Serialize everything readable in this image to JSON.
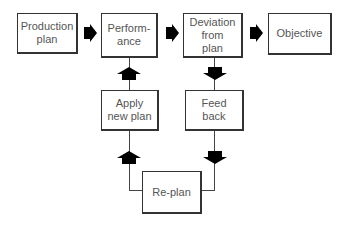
{
  "diagram": {
    "type": "flowchart",
    "boxes": {
      "production_plan": "Production\nplan",
      "performance": "Perform-\nance",
      "deviation": "Deviation\nfrom\nplan",
      "objective": "Objective",
      "apply_new_plan": "Apply\nnew plan",
      "feed_back": "Feed\nback",
      "re_plan": "Re-plan"
    },
    "arrow_color": "#000000",
    "edges": [
      {
        "from": "Production plan",
        "to": "Performance"
      },
      {
        "from": "Performance",
        "to": "Deviation from plan"
      },
      {
        "from": "Deviation from plan",
        "to": "Objective"
      },
      {
        "from": "Deviation from plan",
        "to": "Feed back"
      },
      {
        "from": "Feed back",
        "to": "Re-plan"
      },
      {
        "from": "Re-plan",
        "to": "Apply new plan"
      },
      {
        "from": "Apply new plan",
        "to": "Performance"
      }
    ]
  }
}
